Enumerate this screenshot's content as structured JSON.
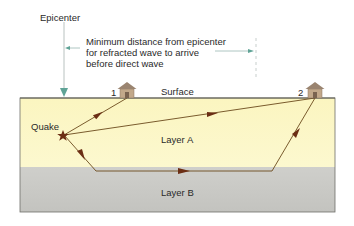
{
  "labels": {
    "epicenter": "Epicenter",
    "min_distance_line1": "Minimum distance from epicenter",
    "min_distance_line2": "for refracted wave to arrive",
    "min_distance_line3": "before direct wave",
    "surface": "Surface",
    "quake": "Quake",
    "layer_a": "Layer A",
    "layer_b": "Layer B",
    "station_1": "1",
    "station_2": "2"
  },
  "colors": {
    "layer_a": "#fbf6c4",
    "layer_b": "#c9c9c6",
    "wave_path": "#6b4a1c",
    "arrowhead": "#6b2e14",
    "quake_star": "#6b2e14",
    "epicenter_arrow": "#5fa396",
    "house_wall": "#c2a88a",
    "house_roof": "#9a8470"
  }
}
